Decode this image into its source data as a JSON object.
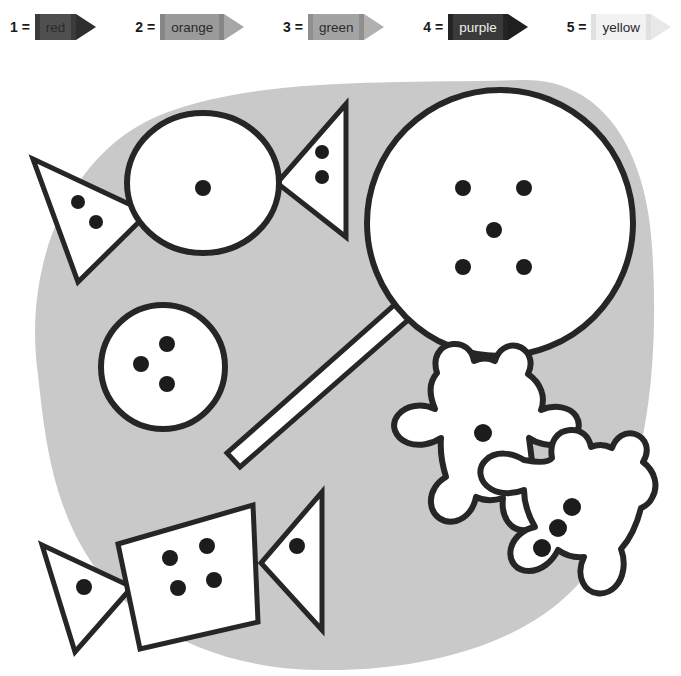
{
  "legend": {
    "title": "color key",
    "entries": [
      {
        "number": "1 =",
        "color_name": "red",
        "swatch": "#4f4f4f",
        "band": "#3b3b3b",
        "tip": "#2e2e2e"
      },
      {
        "number": "2 =",
        "color_name": "orange",
        "swatch": "#9a9a9a",
        "band": "#868686",
        "tip": "#a6a6a6"
      },
      {
        "number": "3 =",
        "color_name": "green",
        "swatch": "#a3a3a3",
        "band": "#8f8f8f",
        "tip": "#b0b0b0"
      },
      {
        "number": "4 =",
        "color_name": "purple",
        "swatch": "#3a3a3a",
        "band": "#242424",
        "tip": "#1f1f1f"
      },
      {
        "number": "5 =",
        "color_name": "yellow",
        "swatch": "#f2f2f2",
        "band": "#e0e0e0",
        "tip": "#e8e8e8"
      }
    ]
  },
  "canvas": {
    "background_color": "#ffffff",
    "blob_color": "#c9c9c9",
    "outline_color": "#262626",
    "fill_color": "#ffffff",
    "dot_color": "#1c1c1c",
    "width": 681,
    "height": 676
  },
  "shapes": [
    {
      "id": "wrapped-candy-top",
      "name": "wrapped round candy (top left)",
      "parts": [
        {
          "part": "left-wrapper-triangle",
          "dot_count": 2
        },
        {
          "part": "candy-circle",
          "dot_count": 1
        },
        {
          "part": "right-wrapper-triangle",
          "dot_count": 2
        }
      ]
    },
    {
      "id": "lollipop",
      "name": "round lollipop with stick (top right)",
      "parts": [
        {
          "part": "lollipop-head",
          "dot_count": 5
        },
        {
          "part": "lollipop-stick",
          "dot_count": 0
        }
      ]
    },
    {
      "id": "small-button-candy",
      "name": "small round candy (middle left)",
      "parts": [
        {
          "part": "small-circle",
          "dot_count": 3
        }
      ]
    },
    {
      "id": "gummy-bear-upper",
      "name": "gummy bear (upper right)",
      "parts": [
        {
          "part": "bear-body",
          "dot_count": 1
        }
      ]
    },
    {
      "id": "gummy-bear-lower",
      "name": "gummy bear (lower right)",
      "parts": [
        {
          "part": "bear-body",
          "dot_count": 3
        }
      ]
    },
    {
      "id": "wrapped-candy-bottom",
      "name": "wrapped square candy (bottom left)",
      "parts": [
        {
          "part": "left-wrapper-triangle",
          "dot_count": 1
        },
        {
          "part": "candy-quad",
          "dot_count": 4
        },
        {
          "part": "right-wrapper-triangle",
          "dot_count": 1
        }
      ]
    }
  ]
}
